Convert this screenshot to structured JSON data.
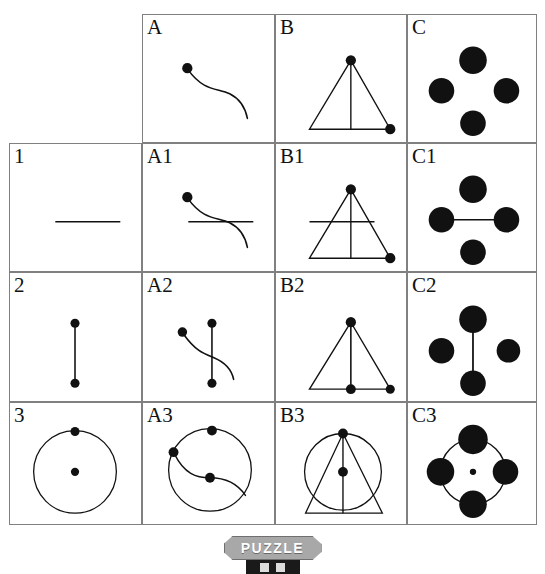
{
  "puzzle": {
    "badge_label": "PUZZLE",
    "grid": {
      "columns": [
        "",
        "A",
        "B",
        "C"
      ],
      "rows": [
        "",
        "1",
        "2",
        "3"
      ],
      "cells": [
        {
          "id": "corner",
          "label": "",
          "col": 0,
          "row": 0,
          "shapes": []
        },
        {
          "id": "col-A",
          "label": "A",
          "col": 1,
          "row": 0,
          "shapes": [
            "s-curve",
            "dot-curve-start"
          ]
        },
        {
          "id": "col-B",
          "label": "B",
          "col": 2,
          "row": 0,
          "shapes": [
            "triangle",
            "altitude",
            "dot-apex",
            "dot-bottom-right"
          ]
        },
        {
          "id": "col-C",
          "label": "C",
          "col": 3,
          "row": 0,
          "shapes": [
            "dot-top",
            "dot-left",
            "dot-right",
            "dot-bottom"
          ]
        },
        {
          "id": "row-1",
          "label": "1",
          "col": 0,
          "row": 1,
          "shapes": [
            "horizontal-line"
          ]
        },
        {
          "id": "cell-A1",
          "label": "A1",
          "col": 1,
          "row": 1,
          "shapes": [
            "s-curve",
            "dot-curve-start",
            "horizontal-line"
          ]
        },
        {
          "id": "cell-B1",
          "label": "B1",
          "col": 2,
          "row": 1,
          "shapes": [
            "triangle",
            "altitude",
            "dot-apex",
            "dot-bottom-right",
            "horizontal-line"
          ]
        },
        {
          "id": "cell-C1",
          "label": "C1",
          "col": 3,
          "row": 1,
          "shapes": [
            "dot-top",
            "dot-left",
            "dot-right",
            "dot-bottom",
            "horizontal-line"
          ]
        },
        {
          "id": "row-2",
          "label": "2",
          "col": 0,
          "row": 2,
          "shapes": [
            "vertical-line",
            "dot-top",
            "dot-bottom"
          ]
        },
        {
          "id": "cell-A2",
          "label": "A2",
          "col": 1,
          "row": 2,
          "shapes": [
            "s-curve",
            "dot-curve-start",
            "vertical-line",
            "dot-top",
            "dot-bottom"
          ]
        },
        {
          "id": "cell-B2",
          "label": "B2",
          "col": 2,
          "row": 2,
          "shapes": [
            "triangle",
            "altitude",
            "dot-apex",
            "dot-bottom-right",
            "vertical-line",
            "dot-mid-bottom"
          ]
        },
        {
          "id": "cell-C2",
          "label": "C2",
          "col": 3,
          "row": 2,
          "shapes": [
            "dot-top",
            "dot-left",
            "dot-right",
            "dot-bottom",
            "vertical-line"
          ]
        },
        {
          "id": "row-3",
          "label": "3",
          "col": 0,
          "row": 3,
          "shapes": [
            "circle",
            "dot-on-circle-top",
            "dot-center"
          ]
        },
        {
          "id": "cell-A3",
          "label": "A3",
          "col": 1,
          "row": 3,
          "shapes": [
            "circle",
            "s-curve",
            "dot-on-circle-top",
            "dot-on-circle-left",
            "dot-center"
          ]
        },
        {
          "id": "cell-B3",
          "label": "B3",
          "col": 2,
          "row": 3,
          "shapes": [
            "circle",
            "triangle",
            "altitude",
            "dot-apex",
            "dot-center"
          ]
        },
        {
          "id": "cell-C3",
          "label": "C3",
          "col": 3,
          "row": 3,
          "shapes": [
            "circle",
            "dot-top",
            "dot-left",
            "dot-right",
            "dot-bottom",
            "dot-center-small"
          ]
        }
      ]
    },
    "colors": {
      "ink": "#111111",
      "grid_line": "#808080",
      "badge_fill": "#a8a8a8",
      "badge_text": "#ffffff",
      "background": "#ffffff"
    }
  }
}
